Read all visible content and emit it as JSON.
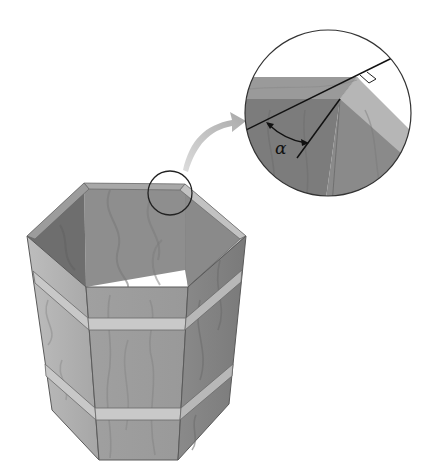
{
  "figure": {
    "labels": {
      "angle": "α"
    },
    "colors": {
      "background": "#ffffff",
      "wood_light": "#b4b4b4",
      "wood_mid": "#8f8f8f",
      "wood_dark": "#6f6f6f",
      "rim_light": "#c6c6c6",
      "band": "#c9c9c9",
      "outline": "#5a5a5a",
      "line": "#111111",
      "arrow": "#b8b8b8"
    },
    "inset": {
      "description": "Magnified view of rim corner showing angle α between rim line and corner seam, with right-angle marker"
    }
  }
}
